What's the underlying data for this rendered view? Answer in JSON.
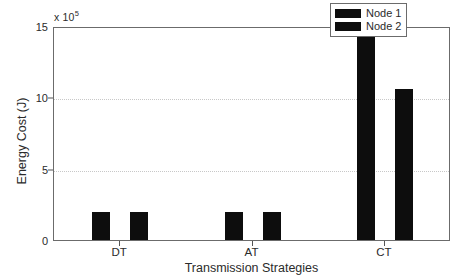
{
  "chart_data": {
    "type": "bar",
    "title": "",
    "subtitle": "",
    "xlabel": "Transmission Strategies",
    "ylabel": "Energy Cost (J)",
    "y_exponent_prefix": "x 10",
    "y_exponent_power": "5",
    "categories": [
      "DT",
      "AT",
      "CT"
    ],
    "series": [
      {
        "name": "Node 1",
        "color": "#0d0d0d",
        "values": [
          1.95,
          1.95,
          14.2
        ]
      },
      {
        "name": "Node 2",
        "color": "#0d0d0d",
        "values": [
          1.95,
          1.95,
          10.6
        ]
      }
    ],
    "yticks": [
      0,
      5,
      10,
      15
    ],
    "ytick_labels": [
      "0",
      "5",
      "10",
      "15"
    ],
    "ylim": [
      0,
      15
    ],
    "xlim": [
      0,
      3
    ],
    "grid": true,
    "grid_style": "dotted",
    "legend_position": "top-right",
    "legend_entries": [
      "Node 1",
      "Node 2"
    ],
    "value_units": "1e5 J",
    "axis_color": "#6b6b6b",
    "grid_color": "#c8c8c8",
    "background_color": "#ffffff",
    "text_color": "#2b2b2b"
  }
}
